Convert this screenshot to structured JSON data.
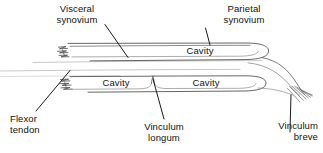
{
  "figure": {
    "stroke_color": "#3a3a3a",
    "faint_stroke_color": "#9a9a9a",
    "text_color": "#111111",
    "background": "#ffffff",
    "width": 323,
    "height": 153
  },
  "labels": {
    "visceral_synovium": "Visceral\nsynovium",
    "parietal_synovium": "Parietal\nsynovium",
    "flexor_tendon": "Flexor\ntendon",
    "vinculum_longum": "Vinculum\nlongum",
    "vinculum_breve": "Vinculum\nbreve"
  },
  "cavities": {
    "upper": "Cavity",
    "lower_proximal": "Cavity",
    "lower_distal": "Cavity"
  }
}
